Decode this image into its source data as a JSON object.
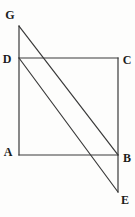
{
  "figure": {
    "canvas": {
      "width": 135,
      "height": 217
    },
    "background_color": "#fdfdfc",
    "line_color": "#3a3a3a",
    "line_width": 1.2,
    "label_color": "#1c1c1c",
    "points": {
      "G": {
        "x": 19,
        "y": 26
      },
      "D": {
        "x": 19,
        "y": 58
      },
      "A": {
        "x": 19,
        "y": 155
      },
      "C": {
        "x": 118,
        "y": 58
      },
      "B": {
        "x": 118,
        "y": 155
      },
      "E": {
        "x": 118,
        "y": 192
      }
    },
    "segments": [
      {
        "from": "G",
        "to": "A"
      },
      {
        "from": "D",
        "to": "C"
      },
      {
        "from": "A",
        "to": "B"
      },
      {
        "from": "C",
        "to": "E"
      },
      {
        "from": "G",
        "to": "B"
      },
      {
        "from": "D",
        "to": "E"
      }
    ],
    "labels": [
      {
        "text": "G",
        "x": 10,
        "y": 15
      },
      {
        "text": "D",
        "x": 7,
        "y": 59
      },
      {
        "text": "C",
        "x": 127,
        "y": 60
      },
      {
        "text": "A",
        "x": 8,
        "y": 152
      },
      {
        "text": "B",
        "x": 127,
        "y": 158
      },
      {
        "text": "E",
        "x": 125,
        "y": 200
      }
    ]
  }
}
